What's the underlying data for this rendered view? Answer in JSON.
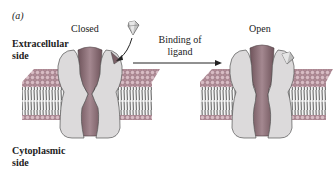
{
  "figure": {
    "panel_label": "(a)",
    "states": {
      "closed": {
        "label": "Closed"
      },
      "open": {
        "label": "Open"
      }
    },
    "side_labels": {
      "extracellular": [
        "Extracellular",
        "side"
      ],
      "cytoplasmic": [
        "Cytoplasmic",
        "side"
      ]
    },
    "transition": {
      "label_lines": [
        "Binding of",
        "ligand"
      ]
    },
    "colors": {
      "channel_subunit": "#dcdadb",
      "channel_pore": "#8c6f76",
      "lipid_head": "#c9a9b2",
      "lipid_tail": "#666666",
      "ligand": "#bdbdbd",
      "text": "#222222"
    }
  }
}
